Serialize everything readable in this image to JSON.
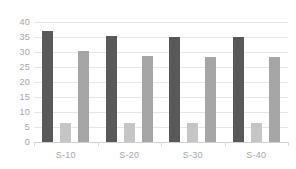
{
  "chart_data": {
    "type": "bar",
    "title": "",
    "subtitle": "",
    "xlabel": "",
    "ylabel": "",
    "categories": [
      "S-10",
      "S-20",
      "S-30",
      "S-40"
    ],
    "series": [
      {
        "name": "Series 1",
        "color": "#595959",
        "values": [
          37.0,
          35.5,
          35.0,
          35.0
        ]
      },
      {
        "name": "Series 2",
        "color": "#c5c5c5",
        "values": [
          6.5,
          6.5,
          6.3,
          6.3
        ]
      },
      {
        "name": "Series 3",
        "color": "#a6a6a6",
        "values": [
          30.3,
          28.8,
          28.2,
          28.2
        ]
      }
    ],
    "ylim": [
      0,
      40
    ],
    "ytick_values": [
      0,
      5,
      10,
      15,
      20,
      25,
      30,
      35,
      40
    ],
    "ytick_labels": [
      "0",
      "5",
      "10",
      "15",
      "20",
      "25",
      "30",
      "35",
      "40"
    ],
    "grid": true,
    "grid_color": "#e6e6e6",
    "legend": false,
    "legend_position": "none",
    "axis_color": "#d0d0d0",
    "tick_label_color": "#a6a6a6",
    "background": "#ffffff"
  }
}
